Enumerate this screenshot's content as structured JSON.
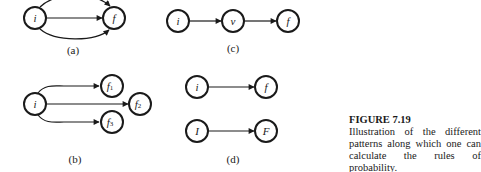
{
  "panels": {
    "a": {
      "label": "(a)",
      "nodes": [
        "i",
        "f"
      ],
      "edges": 3
    },
    "b": {
      "label": "(b)",
      "nodes": [
        "i",
        "f",
        "1",
        "f",
        "2",
        "f",
        "3"
      ]
    },
    "c": {
      "label": "(c)",
      "nodes": [
        "i",
        "v",
        "f"
      ]
    },
    "d": {
      "label": "(d)",
      "nodes": [
        "i",
        "f",
        "I",
        "F"
      ]
    }
  },
  "caption": {
    "title": "FIGURE 7.19",
    "text": "Illustration of the different patterns along which one can calculate the rules of probability."
  }
}
